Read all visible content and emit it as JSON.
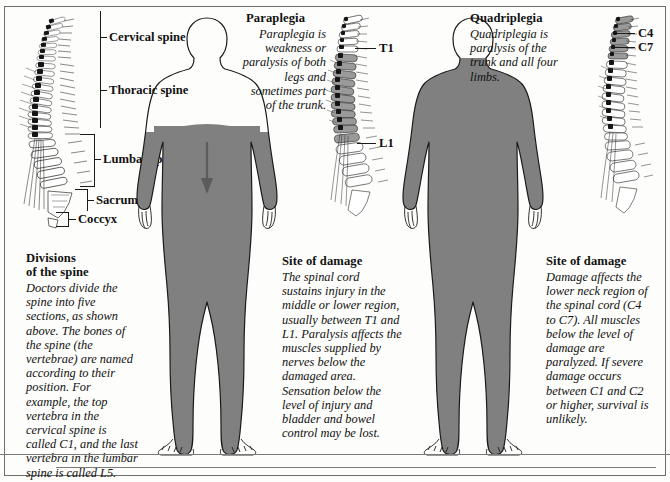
{
  "figure": {
    "colors": {
      "paralysis_shading": "#808080",
      "outline": "#1b1b1b",
      "background": "#fdfdfb",
      "frame": "#6f6f6f",
      "arrow": "#5b5b5b"
    }
  },
  "panel_left": {
    "name": "divisions-of-the-spine",
    "spine_labels": [
      {
        "id": "cervical",
        "text": "Cervical spine"
      },
      {
        "id": "thoracic",
        "text": "Thoracic spine"
      },
      {
        "id": "lumbar",
        "text": "Lumbar spine"
      },
      {
        "id": "sacrum",
        "text": "Sacrum"
      },
      {
        "id": "coccyx",
        "text": "Coccyx"
      }
    ],
    "caption": {
      "heading_line1": "Divisions",
      "heading_line2": "of the spine",
      "body": "Doctors divide the spine into five sections, as shown above. The bones of the spine (the vertebrae) are named according to their position. For example, the top vertebra in the cervical spine is called C1, and the last vertebra in the lumbar spine is called L5."
    }
  },
  "panel_middle": {
    "name": "paraplegia",
    "heading": "Paraplegia",
    "description": "Paraplegia is weakness or paralysis of both legs and sometimes part of the trunk.",
    "vertebra_labels": [
      {
        "id": "t1",
        "text": "T1"
      },
      {
        "id": "l1",
        "text": "L1"
      }
    ],
    "caption": {
      "heading": "Site of damage",
      "body": "The spinal cord sustains injury in the middle or lower region, usually between T1 and L1. Paralysis affects the muscles supplied by nerves below the damaged area. Sensation below the level of injury and bladder and bowel control may be lost."
    }
  },
  "panel_right": {
    "name": "quadriplegia",
    "heading": "Quadriplegia",
    "description": "Quadriplegia is paralysis of the trunk and all four limbs.",
    "vertebra_labels": [
      {
        "id": "c4",
        "text": "C4"
      },
      {
        "id": "c7",
        "text": "C7"
      }
    ],
    "caption": {
      "heading": "Site of damage",
      "body": "Damage affects the lower neck region of the spinal cord (C4 to C7). All muscles below the level of damage are paralyzed. If severe damage occurs between C1 and C2 or higher, survival is unlikely."
    }
  }
}
